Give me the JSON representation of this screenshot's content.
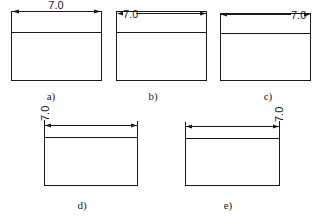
{
  "figure": {
    "panels": [
      {
        "id": "a",
        "caption": "a)",
        "dimension_value": "7.0",
        "text_placement": "centered above dimension line"
      },
      {
        "id": "b",
        "caption": "b)",
        "dimension_value": "7.0",
        "text_placement": "inline at left end, interrupting line"
      },
      {
        "id": "c",
        "caption": "c)",
        "dimension_value": "7.0",
        "text_placement": "inline at right end, interrupting line"
      },
      {
        "id": "d",
        "caption": "d)",
        "dimension_value": "7.0",
        "text_placement": "rotated vertical, above left end"
      },
      {
        "id": "e",
        "caption": "e)",
        "dimension_value": "7.0",
        "text_placement": "rotated vertical, above right end"
      }
    ],
    "colors": {
      "line": "#1a1a1a",
      "background": "#ffffff"
    }
  }
}
